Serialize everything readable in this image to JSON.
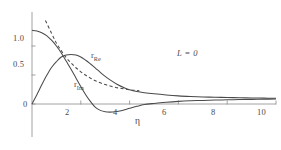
{
  "figure": {
    "annotation": "L = 0",
    "background": "#ffffff",
    "ink_color": "#4a4a4a"
  },
  "chart_data": {
    "type": "line",
    "title": "",
    "xlabel": "η",
    "ylabel": "",
    "xlim": [
      0,
      10
    ],
    "ylim": [
      -0.25,
      1.45
    ],
    "grid": false,
    "legend": "inline-annotations",
    "annotations": [
      {
        "text": "L = 0",
        "x": 6.4,
        "y": 1.02,
        "style": "italic"
      },
      {
        "text": "r_Re",
        "x": 2.55,
        "y": 0.8,
        "style": "curve-label"
      },
      {
        "text": "r_Im",
        "x": 1.95,
        "y": 0.4,
        "style": "curve-label"
      }
    ],
    "xticks": [
      2,
      4,
      6,
      8,
      10
    ],
    "xticklabels": [
      "2",
      "4",
      "6",
      "8",
      "10"
    ],
    "yticks": [
      0,
      0.5,
      1.0
    ],
    "yticklabels": [
      "0",
      "0.5",
      "1.0"
    ],
    "series": [
      {
        "name": "r_Im",
        "style": "solid",
        "x": [
          0.0,
          0.2,
          0.4,
          0.6,
          0.8,
          1.0,
          1.2,
          1.4,
          1.6,
          1.8,
          2.0,
          2.2,
          2.4,
          2.6,
          2.8,
          3.0,
          3.2,
          3.4,
          3.6,
          3.8,
          4.0,
          4.3,
          4.6,
          5.0,
          5.5,
          6.0,
          6.5,
          7.0,
          7.5,
          8.0,
          8.5,
          9.0,
          9.5,
          10.0
        ],
        "values": [
          1.27,
          1.26,
          1.23,
          1.18,
          1.1,
          1.0,
          0.88,
          0.74,
          0.6,
          0.45,
          0.3,
          0.16,
          0.04,
          -0.06,
          -0.11,
          -0.135,
          -0.14,
          -0.135,
          -0.12,
          -0.1,
          -0.075,
          -0.04,
          -0.01,
          0.01,
          0.03,
          0.045,
          0.055,
          0.062,
          0.068,
          0.072,
          0.076,
          0.08,
          0.083,
          0.086
        ]
      },
      {
        "name": "r_Re",
        "style": "solid",
        "x": [
          0.0,
          0.2,
          0.4,
          0.6,
          0.8,
          1.0,
          1.2,
          1.4,
          1.6,
          1.8,
          2.0,
          2.2,
          2.4,
          2.6,
          2.8,
          3.0,
          3.2,
          3.5,
          3.8,
          4.0,
          4.3,
          4.6,
          5.0,
          5.5,
          6.0,
          6.5,
          7.0,
          7.5,
          8.0,
          8.5,
          9.0,
          9.5,
          10.0
        ],
        "values": [
          0.0,
          0.16,
          0.33,
          0.49,
          0.63,
          0.73,
          0.81,
          0.845,
          0.855,
          0.845,
          0.81,
          0.755,
          0.69,
          0.62,
          0.545,
          0.475,
          0.415,
          0.335,
          0.275,
          0.245,
          0.215,
          0.195,
          0.175,
          0.155,
          0.14,
          0.13,
          0.122,
          0.116,
          0.112,
          0.108,
          0.104,
          0.101,
          0.098
        ]
      },
      {
        "name": "dashed-reference",
        "style": "dashed",
        "x": [
          0.55,
          0.8,
          1.0,
          1.2,
          1.4,
          1.6,
          1.8,
          2.0,
          2.2,
          2.4,
          2.6,
          2.8,
          3.0,
          3.2,
          3.4,
          3.6,
          3.8,
          4.0,
          4.2,
          4.4
        ],
        "values": [
          1.44,
          1.22,
          1.05,
          0.92,
          0.8,
          0.71,
          0.625,
          0.555,
          0.495,
          0.445,
          0.4,
          0.365,
          0.335,
          0.31,
          0.29,
          0.272,
          0.258,
          0.246,
          0.237,
          0.23
        ]
      }
    ]
  },
  "axes": {
    "y_labels": [
      "1.0",
      "0.5",
      "0"
    ],
    "x_labels": [
      "2",
      "4",
      "6",
      "8",
      "10"
    ],
    "x_axis_title": "η"
  },
  "curve_labels": {
    "re": {
      "base": "r",
      "sub": "Re"
    },
    "im": {
      "base": "r",
      "sub": "Im"
    }
  }
}
